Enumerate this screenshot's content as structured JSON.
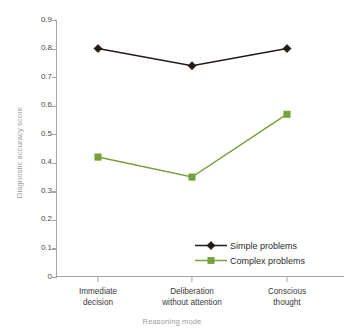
{
  "chart_data": {
    "type": "line",
    "title": "",
    "xlabel": "Reasoning mode",
    "ylabel": "Diagnostic accuracy score",
    "categories": [
      "Immediate decision",
      "Deliberation without attention",
      "Conscious thought"
    ],
    "category_lines": [
      [
        "Immediate",
        "decision"
      ],
      [
        "Deliberation",
        "without attention"
      ],
      [
        "Conscious",
        "thought"
      ]
    ],
    "series": [
      {
        "name": "Simple problems",
        "values": [
          0.8,
          0.74,
          0.8
        ],
        "color": "#231a17",
        "marker": "diamond"
      },
      {
        "name": "Complex problems",
        "values": [
          0.42,
          0.35,
          0.57
        ],
        "color": "#76a13a",
        "marker": "square"
      }
    ],
    "ylim": [
      0,
      0.9
    ],
    "yticks": [
      0,
      0.1,
      0.2,
      0.3,
      0.4,
      0.5,
      0.6,
      0.7,
      0.8,
      0.9
    ],
    "ytick_labels": [
      "0",
      "0.1",
      "0.2",
      "0.3",
      "0.4",
      "0.5",
      "0.6",
      "0.7",
      "0.8",
      "0.9"
    ],
    "grid": false,
    "legend_position": "lower-right-inside",
    "axis_color": "#a6a6a6",
    "axis_title_color": "#9b9b9b"
  }
}
